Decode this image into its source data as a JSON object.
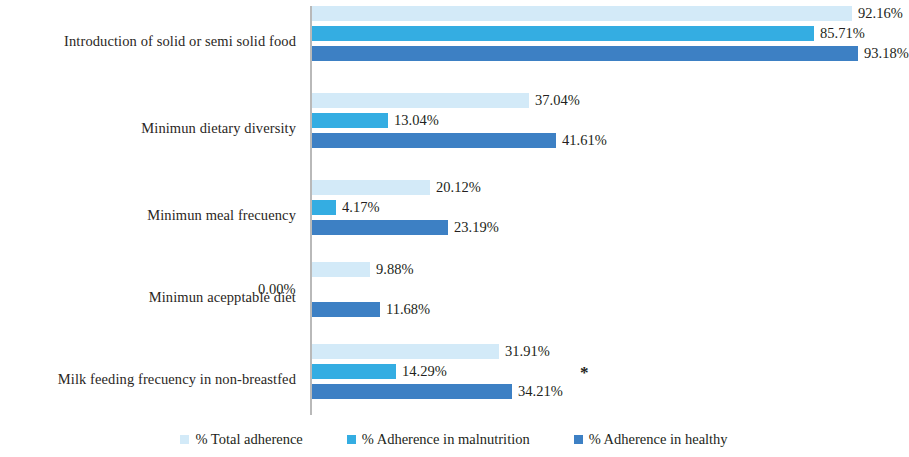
{
  "chart_data": {
    "type": "bar",
    "orientation": "horizontal",
    "title": "",
    "subtitle": "",
    "xlabel": "",
    "ylabel": "",
    "xlim": [
      0,
      100
    ],
    "grid": false,
    "legend_position": "bottom-center",
    "value_suffix": "%",
    "categories": [
      "Introduction of solid or semi solid food",
      "Minimun dietary diversity",
      "Minimun meal frecuency",
      "Minimun acepptable diet",
      "Milk feeding frecuency in non-breastfed"
    ],
    "series": [
      {
        "name": "% Total adherence",
        "color": "#d3eaf8",
        "values": [
          92.16,
          37.04,
          20.12,
          9.88,
          31.91
        ],
        "labels": [
          "92.16%",
          "37.04%",
          "20.12%",
          "9.88%",
          "31.91%"
        ]
      },
      {
        "name": "% Adherence in malnutrition",
        "color": "#34ade2",
        "values": [
          85.71,
          13.04,
          4.17,
          0.0,
          14.29
        ],
        "labels": [
          "85.71%",
          "13.04%",
          "4.17%",
          "0.00%",
          "14.29%"
        ]
      },
      {
        "name": "% Adherence in healthy",
        "color": "#3d80c4",
        "values": [
          93.18,
          41.61,
          23.19,
          11.68,
          34.21
        ],
        "labels": [
          "93.18%",
          "41.61%",
          "23.19%",
          "11.68%",
          "34.21%"
        ]
      }
    ],
    "annotations": [
      {
        "text": "*",
        "category": "Milk feeding frecuency in non-breastfed",
        "name": "significance-asterisk"
      }
    ]
  },
  "legend": {
    "items": [
      {
        "label": "% Total adherence",
        "color": "#d3eaf8"
      },
      {
        "label": "% Adherence in malnutrition",
        "color": "#34ade2"
      },
      {
        "label": "% Adherence in healthy",
        "color": "#3d80c4"
      }
    ]
  }
}
